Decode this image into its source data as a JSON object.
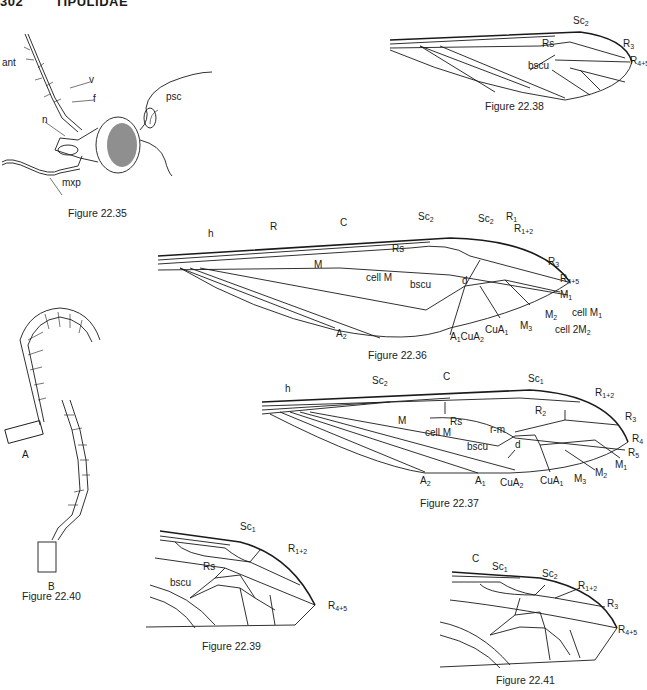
{
  "header": {
    "page_number": "302",
    "section": "TIPULIDAE"
  },
  "figures": [
    {
      "id": "fig-22-35",
      "caption": "Figure 22.35",
      "subject": "head, lateral view",
      "labels": {
        "ant": "ant",
        "v": "v",
        "f": "f",
        "psc": "psc",
        "n": "n",
        "mxp": "mxp"
      }
    },
    {
      "id": "fig-22-38",
      "caption": "Figure 22.38",
      "subject": "wing",
      "labels": {
        "sc2": "Sc",
        "sc2_sub": "2",
        "rs": "Rs",
        "bscu": "bscu",
        "r3": "R",
        "r3_sub": "3",
        "r45": "R",
        "r45_sub": "4+5"
      }
    },
    {
      "id": "fig-22-36",
      "caption": "Figure 22.36",
      "subject": "wing",
      "labels": {
        "h": "h",
        "r": "R",
        "c": "C",
        "sc2a": "Sc",
        "sc2a_sub": "2",
        "sc2b": "Sc",
        "sc2b_sub": "2",
        "r1": "R",
        "r1_sub": "1",
        "r12": "R",
        "r12_sub": "1+2",
        "rs": "Rs",
        "m": "M",
        "cellm": "cell M",
        "r3": "R",
        "r3_sub": "3",
        "r45": "R",
        "r45_sub": "4+5",
        "bscu": "bscu",
        "d": "d",
        "m1": "M",
        "m1_sub": "1",
        "cellm1": "cell M",
        "cellm1_sub": "1",
        "m2": "M",
        "m2_sub": "2",
        "cell2m2": "cell 2M",
        "cell2m2_sub": "2",
        "m3": "M",
        "m3_sub": "3",
        "a2": "A",
        "a2_sub": "2",
        "a1": "A",
        "a1_sub": "1",
        "cua2": "CuA",
        "cua2_sub": "2",
        "cua1": "CuA",
        "cua1_sub": "1"
      }
    },
    {
      "id": "fig-22-37",
      "caption": "Figure 22.37",
      "subject": "wing",
      "labels": {
        "h": "h",
        "sc2": "Sc",
        "sc2_sub": "2",
        "c": "C",
        "sc1": "Sc",
        "sc1_sub": "1",
        "r12": "R",
        "r12_sub": "1+2",
        "r2": "R",
        "r2_sub": "2",
        "rs": "Rs",
        "rm": "r-m",
        "m": "M",
        "cellm": "cell M",
        "bscu": "bscu",
        "d": "d",
        "r3": "R",
        "r3_sub": "3",
        "r4": "R",
        "r4_sub": "4",
        "r5": "R",
        "r5_sub": "5",
        "m1": "M",
        "m1_sub": "1",
        "m2": "M",
        "m2_sub": "2",
        "m3": "M",
        "m3_sub": "3",
        "a2": "A",
        "a2_sub": "2",
        "a1": "A",
        "a1_sub": "1",
        "cua2": "CuA",
        "cua2_sub": "2",
        "cua1": "CuA",
        "cua1_sub": "1"
      }
    },
    {
      "id": "fig-22-40",
      "caption": "Figure 22.40",
      "subject": "antennae",
      "labels": {
        "a": "A",
        "b": "B"
      }
    },
    {
      "id": "fig-22-39",
      "caption": "Figure 22.39",
      "subject": "wing apex",
      "labels": {
        "sc1": "Sc",
        "sc1_sub": "1",
        "r12": "R",
        "r12_sub": "1+2",
        "rs": "Rs",
        "bscu": "bscu",
        "r45": "R",
        "r45_sub": "4+5"
      }
    },
    {
      "id": "fig-22-41",
      "caption": "Figure 22.41",
      "subject": "wing apex",
      "labels": {
        "c": "C",
        "sc1": "Sc",
        "sc1_sub": "1",
        "sc2": "Sc",
        "sc2_sub": "2",
        "r12": "R",
        "r12_sub": "1+2",
        "r3": "R",
        "r3_sub": "3",
        "r45": "R",
        "r45_sub": "4+5"
      }
    }
  ]
}
